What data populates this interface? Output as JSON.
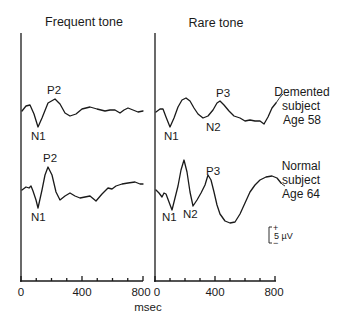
{
  "chart_data": {
    "type": "line",
    "title": "",
    "xlabel": "msec",
    "ylabel": "",
    "xlim": [
      0,
      800
    ],
    "x_ticks": [
      0,
      400,
      800
    ],
    "x_minor_tick_step": 100,
    "grid": false,
    "panels": [
      {
        "title": "Frequent tone",
        "series": [
          {
            "name": "Demented subject Age 58",
            "peaks": [
              {
                "label": "N1",
                "x_ms": 110
              },
              {
                "label": "P2",
                "x_ms": 220
              }
            ],
            "points_px": [
              [
                22,
                111
              ],
              [
                26,
                106
              ],
              [
                30,
                105
              ],
              [
                34,
                114
              ],
              [
                38,
                127
              ],
              [
                42,
                118
              ],
              [
                48,
                103
              ],
              [
                55,
                99
              ],
              [
                60,
                104
              ],
              [
                65,
                113
              ],
              [
                70,
                116
              ],
              [
                76,
                114
              ],
              [
                82,
                109
              ],
              [
                90,
                107
              ],
              [
                97,
                109
              ],
              [
                105,
                111
              ],
              [
                110,
                110
              ],
              [
                115,
                110
              ],
              [
                120,
                113
              ],
              [
                124,
                110
              ],
              [
                128,
                108
              ],
              [
                133,
                110
              ],
              [
                138,
                112
              ],
              [
                143,
                111
              ]
            ]
          },
          {
            "name": "Normal subject Age 64",
            "peaks": [
              {
                "label": "N1",
                "x_ms": 110
              },
              {
                "label": "P2",
                "x_ms": 180
              }
            ],
            "points_px": [
              [
                22,
                190
              ],
              [
                26,
                187
              ],
              [
                29,
                188
              ],
              [
                31,
                186
              ],
              [
                33,
                191
              ],
              [
                36,
                200
              ],
              [
                38,
                208
              ],
              [
                42,
                190
              ],
              [
                45,
                175
              ],
              [
                48,
                167
              ],
              [
                52,
                175
              ],
              [
                56,
                192
              ],
              [
                60,
                200
              ],
              [
                65,
                196
              ],
              [
                70,
                193
              ],
              [
                75,
                196
              ],
              [
                80,
                198
              ],
              [
                85,
                197
              ],
              [
                90,
                196
              ],
              [
                96,
                201
              ],
              [
                102,
                194
              ],
              [
                108,
                188
              ],
              [
                112,
                189
              ],
              [
                116,
                186
              ],
              [
                122,
                184
              ],
              [
                128,
                183
              ],
              [
                135,
                182
              ],
              [
                140,
                184
              ],
              [
                143,
                184
              ]
            ]
          }
        ]
      },
      {
        "title": "Rare tone",
        "series": [
          {
            "name": "Demented subject Age 58",
            "peaks": [
              {
                "label": "N1",
                "x_ms": 110
              },
              {
                "label": "N2",
                "x_ms": 320
              },
              {
                "label": "P3",
                "x_ms": 430
              }
            ],
            "points_px": [
              [
                156,
                112
              ],
              [
                160,
                109
              ],
              [
                163,
                109
              ],
              [
                166,
                117
              ],
              [
                170,
                127
              ],
              [
                174,
                118
              ],
              [
                178,
                107
              ],
              [
                182,
                100
              ],
              [
                186,
                98
              ],
              [
                190,
                101
              ],
              [
                194,
                108
              ],
              [
                198,
                114
              ],
              [
                203,
                118
              ],
              [
                208,
                116
              ],
              [
                213,
                110
              ],
              [
                217,
                103
              ],
              [
                220,
                101
              ],
              [
                224,
                105
              ],
              [
                229,
                111
              ],
              [
                234,
                116
              ],
              [
                240,
                118
              ],
              [
                245,
                121
              ],
              [
                250,
                120
              ],
              [
                255,
                121
              ],
              [
                260,
                121
              ],
              [
                264,
                124
              ],
              [
                268,
                117
              ],
              [
                272,
                108
              ],
              [
                276,
                103
              ]
            ]
          },
          {
            "name": "Normal subject Age 64",
            "peaks": [
              {
                "label": "N1",
                "x_ms": 110
              },
              {
                "label": "N2",
                "x_ms": 260
              },
              {
                "label": "P3",
                "x_ms": 340
              }
            ],
            "points_px": [
              [
                156,
                190
              ],
              [
                159,
                193
              ],
              [
                162,
                197
              ],
              [
                164,
                193
              ],
              [
                166,
                194
              ],
              [
                169,
                202
              ],
              [
                172,
                210
              ],
              [
                175,
                198
              ],
              [
                178,
                186
              ],
              [
                181,
                170
              ],
              [
                184,
                160
              ],
              [
                187,
                172
              ],
              [
                190,
                192
              ],
              [
                193,
                206
              ],
              [
                197,
                200
              ],
              [
                201,
                193
              ],
              [
                205,
                185
              ],
              [
                208,
                175
              ],
              [
                211,
                180
              ],
              [
                214,
                192
              ],
              [
                217,
                205
              ],
              [
                220,
                214
              ],
              [
                225,
                221
              ],
              [
                230,
                223
              ],
              [
                235,
                222
              ],
              [
                240,
                214
              ],
              [
                245,
                203
              ],
              [
                250,
                192
              ],
              [
                255,
                185
              ],
              [
                260,
                180
              ],
              [
                266,
                177
              ],
              [
                272,
                176
              ],
              [
                277,
                178
              ],
              [
                281,
                183
              ]
            ]
          }
        ]
      }
    ],
    "legend": [],
    "annotations": [
      "Demented subject Age 58",
      "Normal subject Age 64",
      "5 µV scale bar (+ up, − down)"
    ]
  },
  "panels": {
    "left_title": "Frequent tone",
    "right_title": "Rare tone"
  },
  "peak_labels": {
    "freq_top_n1": "N1",
    "freq_top_p2": "P2",
    "freq_bot_n1": "N1",
    "freq_bot_p2": "P2",
    "rare_top_n1": "N1",
    "rare_top_n2": "N2",
    "rare_top_p3": "P3",
    "rare_bot_n1": "N1",
    "rare_bot_n2": "N2",
    "rare_bot_p3": "P3"
  },
  "side_labels": {
    "demented": [
      "Demented",
      "subject",
      "Age 58"
    ],
    "normal": [
      "Normal",
      "subject",
      "Age 64"
    ]
  },
  "axis": {
    "left_ticks": [
      "0",
      "400",
      "800"
    ],
    "right_ticks": [
      "0",
      "400",
      "800"
    ],
    "xlabel": "msec"
  },
  "scale_bar": {
    "plus": "+",
    "minus": "−",
    "label": "5 µV"
  }
}
